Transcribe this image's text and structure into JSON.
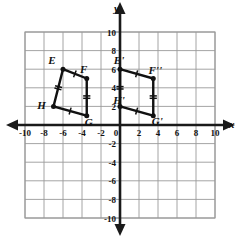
{
  "figure": {
    "axis_x_name": "x",
    "axis_y_name": "y"
  },
  "chart_data": {
    "type": "scatter",
    "title": "",
    "xlabel": "x",
    "ylabel": "y",
    "xlim": [
      -10,
      10
    ],
    "ylim": [
      -10,
      10
    ],
    "grid": true,
    "grid_step": 2,
    "legend": "none",
    "x_tick_labels": [
      "-10",
      "-8",
      "-6",
      "-4",
      "-2",
      "0",
      "2",
      "4",
      "6",
      "8",
      "10"
    ],
    "x_ticks": [
      -10,
      -8,
      -6,
      -4,
      -2,
      0,
      2,
      4,
      6,
      8,
      10
    ],
    "y_tick_labels": [
      "10",
      "8",
      "6",
      "4",
      "2",
      "-2",
      "-4",
      "-6",
      "-8",
      "-10"
    ],
    "y_ticks": [
      10,
      8,
      6,
      4,
      2,
      -2,
      -4,
      -6,
      -8,
      -10
    ],
    "series": [
      {
        "name": "EFGH",
        "closed": true,
        "points": [
          {
            "label": "E",
            "x": -6,
            "y": 6,
            "label_dx": -11,
            "label_dy": -5
          },
          {
            "label": "F",
            "x": -3.5,
            "y": 5,
            "label_dx": -3,
            "label_dy": -6
          },
          {
            "label": "G",
            "x": -3.5,
            "y": 1,
            "label_dx": 2,
            "label_dy": 10
          },
          {
            "label": "H",
            "x": -7,
            "y": 2,
            "label_dx": -12,
            "label_dy": 3
          }
        ]
      },
      {
        "name": "E'F''G'H'",
        "closed": true,
        "points": [
          {
            "label": "E'",
            "x": 0,
            "y": 6,
            "label_dx": -1,
            "label_dy": -5
          },
          {
            "label": "F''",
            "x": 3.5,
            "y": 5,
            "label_dx": 2,
            "label_dy": -5
          },
          {
            "label": "G'",
            "x": 3.5,
            "y": 1,
            "label_dx": 4,
            "label_dy": 9
          },
          {
            "label": "H'",
            "x": 0,
            "y": 2,
            "label_dx": -1,
            "label_dy": -2
          }
        ]
      }
    ],
    "congruence_marks": {
      "single_tick_edges": [
        "E-F",
        "H-G",
        "E'-F''",
        "H'-G'"
      ],
      "double_tick_edges": [
        "E-H",
        "F-G",
        "E'-H'",
        "F''-G'"
      ]
    }
  },
  "ticks": {
    "x": [
      {
        "v": -10,
        "text": "-10"
      },
      {
        "v": -8,
        "text": "-8"
      },
      {
        "v": -6,
        "text": "-6"
      },
      {
        "v": -4,
        "text": "-4"
      },
      {
        "v": -2,
        "text": "-2"
      },
      {
        "v": 0,
        "text": "0"
      },
      {
        "v": 2,
        "text": "2"
      },
      {
        "v": 4,
        "text": "4"
      },
      {
        "v": 6,
        "text": "6"
      },
      {
        "v": 8,
        "text": "8"
      },
      {
        "v": 10,
        "text": "10"
      }
    ],
    "y": [
      {
        "v": 10,
        "text": "10"
      },
      {
        "v": 8,
        "text": "8"
      },
      {
        "v": 6,
        "text": "6"
      },
      {
        "v": 4,
        "text": "4"
      },
      {
        "v": 2,
        "text": "2"
      },
      {
        "v": -2,
        "text": "-2"
      },
      {
        "v": -4,
        "text": "-4"
      },
      {
        "v": -6,
        "text": "-6"
      },
      {
        "v": -8,
        "text": "-8"
      },
      {
        "v": -10,
        "text": "-10"
      }
    ]
  }
}
